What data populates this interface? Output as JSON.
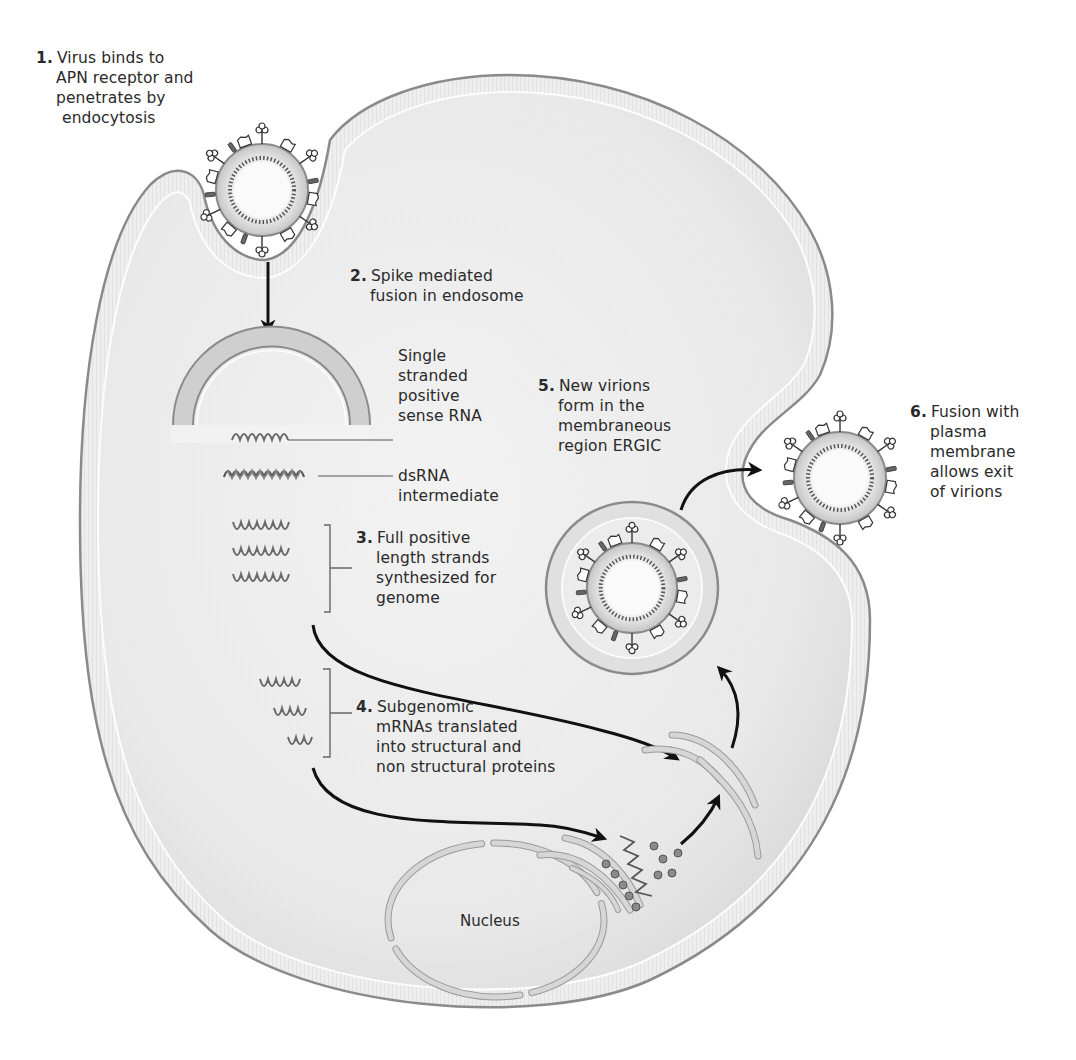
{
  "diagram": {
    "colors": {
      "cytoplasm": "#ececec",
      "membrane": "#c9c9c9",
      "membrane_edge": "#8a8a8a",
      "highlight": "#ffffff",
      "arrow": "#111111",
      "rna": "#6a6a6a",
      "text": "#2a2a2a"
    },
    "steps": [
      {
        "number": "1.",
        "lines": [
          "Virus binds to",
          "APN receptor and",
          "penetrates by",
          "endocytosis"
        ]
      },
      {
        "number": "2.",
        "lines": [
          "Spike mediated",
          "fusion in endosome"
        ]
      },
      {
        "number": "3.",
        "lines": [
          "Full positive",
          "length strands",
          "synthesized for",
          "genome"
        ]
      },
      {
        "number": "4.",
        "lines": [
          "Subgenomic",
          "mRNAs translated",
          "into structural and",
          "non structural proteins"
        ]
      },
      {
        "number": "5.",
        "lines": [
          "New virions",
          "form in the",
          "membraneous",
          "region ERGIC"
        ]
      },
      {
        "number": "6.",
        "lines": [
          "Fusion with",
          "plasma",
          "membrane",
          "allows exit",
          "of virions"
        ]
      }
    ],
    "annotations": {
      "ssrna": [
        "Single",
        "stranded",
        "positive",
        "sense RNA"
      ],
      "dsrna": [
        "dsRNA",
        "intermediate"
      ],
      "nucleus": "Nucleus"
    }
  }
}
